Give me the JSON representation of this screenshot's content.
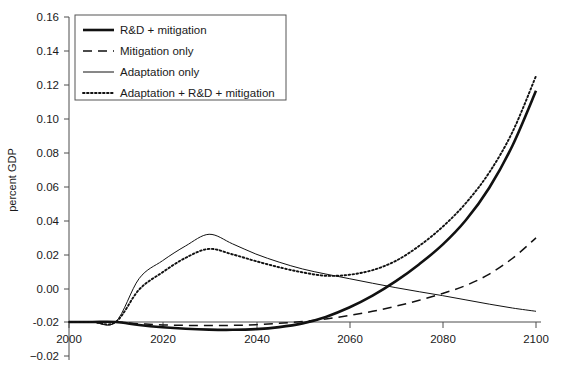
{
  "figure": {
    "background_color": "#ffffff",
    "line_color": "#111111",
    "axis_color": "#4d4d4d"
  },
  "chart_data": {
    "type": "line",
    "title": "",
    "xlabel": "",
    "ylabel": "percent GDP",
    "xlim": [
      2000,
      2100
    ],
    "ylim": [
      -0.02,
      0.16
    ],
    "xticks": [
      2000,
      2020,
      2040,
      2060,
      2080,
      2100
    ],
    "xtick_labels": [
      "2000",
      "2020",
      "2040",
      "2060",
      "2080",
      "2100"
    ],
    "yticks": [
      -0.02,
      0.0,
      0.02,
      0.04,
      0.06,
      0.08,
      0.1,
      0.12,
      0.14,
      0.16
    ],
    "ytick_labels": [
      "-0.02",
      "0.00",
      "0.02",
      "0.04",
      "0.06",
      "0.08",
      "0.10",
      "0.12",
      "0.14",
      "0.16"
    ],
    "grid": false,
    "legend_position": "upper left",
    "x": [
      2000,
      2005,
      2010,
      2015,
      2020,
      2025,
      2030,
      2035,
      2040,
      2045,
      2050,
      2055,
      2060,
      2065,
      2070,
      2075,
      2080,
      2085,
      2090,
      2095,
      2100
    ],
    "series": [
      {
        "name": "R&D + mitigation",
        "style": "solid-thick",
        "values": [
          0.0,
          0.0,
          0.0,
          -0.0018,
          -0.0031,
          -0.004,
          -0.0045,
          -0.0046,
          -0.0042,
          -0.003,
          -0.0008,
          0.003,
          0.0085,
          0.0155,
          0.024,
          0.034,
          0.0455,
          0.06,
          0.079,
          0.104,
          0.136
        ]
      },
      {
        "name": "Mitigation only",
        "style": "dashed",
        "values": [
          0.0,
          0.0,
          0.0,
          -0.001,
          -0.0017,
          -0.002,
          -0.0021,
          -0.002,
          -0.0016,
          -0.0008,
          0.0003,
          0.0018,
          0.0038,
          0.0063,
          0.0093,
          0.0128,
          0.0168,
          0.0215,
          0.0282,
          0.0375,
          0.0495
        ]
      },
      {
        "name": "Adaptation only",
        "style": "solid-thin",
        "values": [
          0.0,
          0.0,
          0.0,
          0.0255,
          0.036,
          0.0448,
          0.0516,
          0.046,
          0.04,
          0.0352,
          0.0312,
          0.0282,
          0.0255,
          0.0228,
          0.0202,
          0.0178,
          0.0155,
          0.013,
          0.0105,
          0.0082,
          0.0063
        ]
      },
      {
        "name": "Adaptation + R&D + mitigation",
        "style": "dotted",
        "values": [
          0.0,
          0.0,
          0.0,
          0.019,
          0.0292,
          0.0378,
          0.043,
          0.0398,
          0.0358,
          0.0322,
          0.0292,
          0.0272,
          0.0278,
          0.0305,
          0.036,
          0.0448,
          0.056,
          0.07,
          0.088,
          0.112,
          0.1447
        ]
      }
    ]
  },
  "legend": {
    "items": [
      {
        "label": "R&D + mitigation",
        "style": "solid-thick"
      },
      {
        "label": "Mitigation only",
        "style": "dashed"
      },
      {
        "label": "Adaptation only",
        "style": "solid-thin"
      },
      {
        "label": "Adaptation + R&D + mitigation",
        "style": "dotted"
      }
    ]
  }
}
